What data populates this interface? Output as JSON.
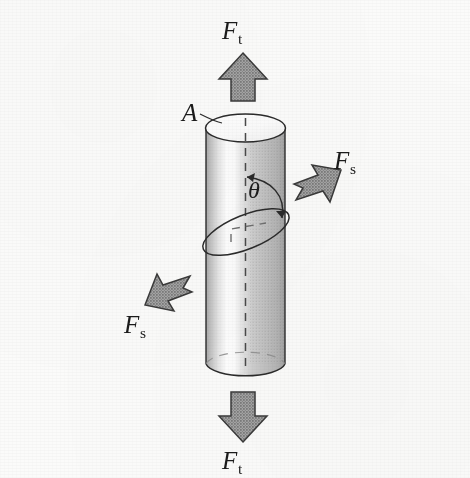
{
  "figure": {
    "background_color": "#fbfbfa",
    "ink_color": "#1b1b1b"
  },
  "labels": {
    "tensile_force_top": {
      "symbol": "F",
      "subscript": "t",
      "text": "F"
    },
    "tensile_force_bottom": {
      "symbol": "F",
      "subscript": "t",
      "text": "F"
    },
    "shear_force_right": {
      "symbol": "F",
      "subscript": "s",
      "text": "F"
    },
    "shear_force_left": {
      "symbol": "F",
      "subscript": "s",
      "text": "F"
    },
    "cross_section_area": {
      "text": "A"
    },
    "angle": {
      "text": "θ"
    }
  },
  "subscripts": {
    "tensile": "t",
    "shear": "s"
  },
  "geometry": {
    "cylinder": {
      "left_x": 206,
      "right_x": 285,
      "top_center_y": 128,
      "bottom_center_y": 364,
      "ellipse_rx": 40,
      "ellipse_ry": 14
    },
    "inclined_plane_ellipse": {
      "center_x": 246,
      "center_y": 232,
      "rx": 46,
      "ry": 17,
      "rotation_deg": -22
    },
    "axis_dashed_line": {
      "x": 246,
      "top_y": 128,
      "bottom_y": 370
    },
    "angle_arc": {
      "label_x": 255,
      "label_y": 190
    }
  },
  "colors": {
    "arrow_fill": "#9d9d9d",
    "arrow_stroke": "#3a3a3a",
    "cylinder_shadow": "#b9b9b9",
    "cylinder_midtone": "#d8d8d8",
    "cylinder_highlight": "#fafafa",
    "outline": "#2b2b2b",
    "dash": "#4a4a4a"
  },
  "arrows": {
    "tensile_up": {
      "direction": "up",
      "kind": "block-arrow"
    },
    "tensile_down": {
      "direction": "down",
      "kind": "block-arrow"
    },
    "shear_right": {
      "direction": "up-right",
      "kind": "block-arrow"
    },
    "shear_left": {
      "direction": "down-left",
      "kind": "block-arrow"
    }
  }
}
